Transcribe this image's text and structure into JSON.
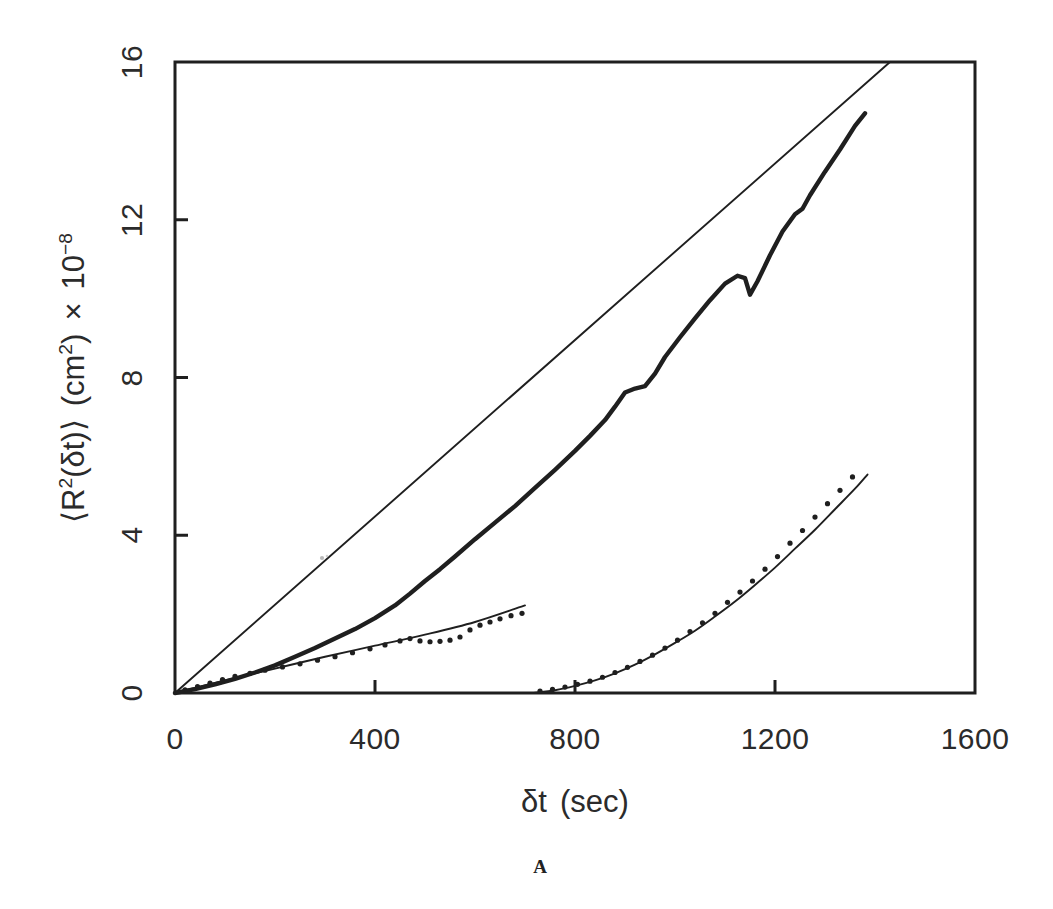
{
  "figure": {
    "panel_label": "A",
    "x_axis_title_parts": {
      "symbol": "δt",
      "unit": "(sec)"
    },
    "y_axis_title_parts": {
      "open_angle": "⟨R",
      "sq": "2",
      "arg": "(δt)",
      "close_angle": "⟩",
      "unit_open": "(cm",
      "unit_sq": "2",
      "unit_close": ")",
      "times": "×",
      "mantissa": "10",
      "exponent": "−8"
    }
  },
  "chart_data": {
    "type": "line",
    "title": "",
    "xlabel": "δt (sec)",
    "ylabel": "⟨R²(δt)⟩ (cm²) × 10⁻⁸",
    "xlim": [
      0,
      1600
    ],
    "ylim": [
      0,
      16
    ],
    "xticks": [
      0,
      400,
      800,
      1200,
      1600
    ],
    "xtick_labels": [
      "0",
      "400",
      "800",
      "1200",
      "1600"
    ],
    "yticks": [
      0,
      4,
      8,
      12,
      16
    ],
    "ytick_labels": [
      "0",
      "4",
      "8",
      "12",
      "16"
    ],
    "grid": false,
    "legend": "none",
    "tick_direction": "in",
    "frame": "box",
    "series": [
      {
        "name": "upper-experimental-trace",
        "style": "thick-solid-line",
        "points": [
          [
            0,
            0.0
          ],
          [
            40,
            0.1
          ],
          [
            80,
            0.22
          ],
          [
            120,
            0.36
          ],
          [
            160,
            0.52
          ],
          [
            200,
            0.7
          ],
          [
            240,
            0.92
          ],
          [
            280,
            1.14
          ],
          [
            320,
            1.38
          ],
          [
            360,
            1.62
          ],
          [
            400,
            1.9
          ],
          [
            440,
            2.22
          ],
          [
            470,
            2.52
          ],
          [
            500,
            2.84
          ],
          [
            530,
            3.14
          ],
          [
            560,
            3.46
          ],
          [
            600,
            3.9
          ],
          [
            640,
            4.32
          ],
          [
            680,
            4.74
          ],
          [
            720,
            5.2
          ],
          [
            760,
            5.66
          ],
          [
            800,
            6.14
          ],
          [
            830,
            6.52
          ],
          [
            860,
            6.92
          ],
          [
            880,
            7.26
          ],
          [
            900,
            7.62
          ],
          [
            920,
            7.72
          ],
          [
            940,
            7.78
          ],
          [
            960,
            8.1
          ],
          [
            980,
            8.52
          ],
          [
            1010,
            9.02
          ],
          [
            1040,
            9.5
          ],
          [
            1070,
            9.96
          ],
          [
            1100,
            10.38
          ],
          [
            1125,
            10.58
          ],
          [
            1140,
            10.52
          ],
          [
            1150,
            10.1
          ],
          [
            1165,
            10.44
          ],
          [
            1190,
            11.1
          ],
          [
            1215,
            11.7
          ],
          [
            1240,
            12.14
          ],
          [
            1255,
            12.28
          ],
          [
            1270,
            12.62
          ],
          [
            1300,
            13.22
          ],
          [
            1330,
            13.78
          ],
          [
            1360,
            14.38
          ],
          [
            1380,
            14.7
          ]
        ]
      },
      {
        "name": "upper-fit-line",
        "style": "thin-solid-line",
        "points": [
          [
            0,
            0.0
          ],
          [
            1430,
            16.0
          ]
        ]
      },
      {
        "name": "middle-dotted-data",
        "style": "dotted-markers",
        "points": [
          [
            20,
            0.08
          ],
          [
            45,
            0.16
          ],
          [
            70,
            0.25
          ],
          [
            95,
            0.34
          ],
          [
            120,
            0.42
          ],
          [
            150,
            0.5
          ],
          [
            180,
            0.58
          ],
          [
            215,
            0.66
          ],
          [
            250,
            0.74
          ],
          [
            285,
            0.83
          ],
          [
            320,
            0.92
          ],
          [
            355,
            1.02
          ],
          [
            390,
            1.12
          ],
          [
            420,
            1.22
          ],
          [
            450,
            1.32
          ],
          [
            470,
            1.38
          ],
          [
            490,
            1.32
          ],
          [
            510,
            1.3
          ],
          [
            530,
            1.31
          ],
          [
            550,
            1.34
          ],
          [
            570,
            1.42
          ],
          [
            590,
            1.6
          ],
          [
            610,
            1.72
          ],
          [
            630,
            1.8
          ],
          [
            650,
            1.88
          ],
          [
            672,
            1.96
          ],
          [
            694,
            2.02
          ]
        ]
      },
      {
        "name": "middle-fit-line",
        "style": "thin-solid-line-curved",
        "points": [
          [
            0,
            0.0
          ],
          [
            100,
            0.32
          ],
          [
            200,
            0.62
          ],
          [
            300,
            0.92
          ],
          [
            400,
            1.2
          ],
          [
            500,
            1.48
          ],
          [
            600,
            1.8
          ],
          [
            700,
            2.22
          ]
        ]
      },
      {
        "name": "lower-right-dotted-data",
        "style": "dotted-markers",
        "points": [
          [
            730,
            0.05
          ],
          [
            755,
            0.09
          ],
          [
            780,
            0.15
          ],
          [
            805,
            0.22
          ],
          [
            830,
            0.3
          ],
          [
            855,
            0.4
          ],
          [
            880,
            0.52
          ],
          [
            905,
            0.65
          ],
          [
            930,
            0.8
          ],
          [
            955,
            0.96
          ],
          [
            980,
            1.14
          ],
          [
            1005,
            1.34
          ],
          [
            1030,
            1.56
          ],
          [
            1055,
            1.78
          ],
          [
            1080,
            2.02
          ],
          [
            1105,
            2.3
          ],
          [
            1130,
            2.56
          ],
          [
            1155,
            2.84
          ],
          [
            1180,
            3.14
          ],
          [
            1205,
            3.46
          ],
          [
            1230,
            3.8
          ],
          [
            1255,
            4.12
          ],
          [
            1280,
            4.46
          ],
          [
            1305,
            4.8
          ],
          [
            1330,
            5.14
          ],
          [
            1355,
            5.48
          ]
        ]
      },
      {
        "name": "lower-right-fit-line",
        "style": "thin-solid-line-curved",
        "points": [
          [
            718,
            0.0
          ],
          [
            760,
            0.07
          ],
          [
            800,
            0.18
          ],
          [
            840,
            0.32
          ],
          [
            880,
            0.5
          ],
          [
            920,
            0.72
          ],
          [
            960,
            0.98
          ],
          [
            1000,
            1.27
          ],
          [
            1040,
            1.58
          ],
          [
            1080,
            1.94
          ],
          [
            1120,
            2.32
          ],
          [
            1160,
            2.74
          ],
          [
            1200,
            3.18
          ],
          [
            1240,
            3.66
          ],
          [
            1280,
            4.14
          ],
          [
            1320,
            4.66
          ],
          [
            1360,
            5.18
          ],
          [
            1385,
            5.54
          ]
        ]
      }
    ]
  }
}
